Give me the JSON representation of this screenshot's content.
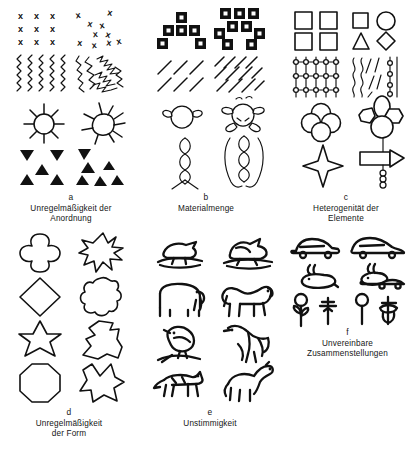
{
  "figure": {
    "title_fragment": "",
    "background_color": "#ffffff",
    "ink_color": "#111111"
  },
  "panels": [
    {
      "id": "a",
      "letter": "a",
      "title_line1": "Unregelmäßigkeit der",
      "title_line2": "Anordnung",
      "title_full": "Unregelmäßigkeit der Anordnung",
      "rows": [
        {
          "name": "x-grid",
          "left": "regular 3x3 grid of X marks",
          "right": "scattered X marks"
        },
        {
          "name": "zigzag-lines",
          "left": "even vertical zigzag lines",
          "right": "uneven tangled zigzag lines"
        },
        {
          "name": "sun",
          "left": "sun with evenly spaced rays",
          "right": "sun with irregular rays"
        },
        {
          "name": "triangles",
          "left": "regularly placed triangles",
          "right": "irregularly placed triangles"
        }
      ]
    },
    {
      "id": "b",
      "letter": "b",
      "title_line1": "Materialmenge",
      "title_line2": "",
      "title_full": "Materialmenge",
      "rows": [
        {
          "name": "filled-squares",
          "left": "six filled squares in a pyramid",
          "right": "nine filled squares, denser"
        },
        {
          "name": "hatching",
          "left": "sparse diagonal hatching",
          "right": "dense diagonal hatching"
        },
        {
          "name": "figure-head",
          "left": "simple head with two arms",
          "right": "head with extra limbs and marks"
        },
        {
          "name": "braid",
          "left": "single braided column",
          "right": "braided column with added outer loops"
        }
      ]
    },
    {
      "id": "c",
      "letter": "c",
      "title_line1": "Heterogenität der",
      "title_line2": "Elemente",
      "title_full": "Heterogenität der Elemente",
      "rows": [
        {
          "name": "shape-quartet",
          "left": "four identical squares",
          "right": "square, circle, triangle, diamond"
        },
        {
          "name": "bead-strings",
          "left": "five identical beaded strings",
          "right": "wavy lines mixed with a beaded string"
        },
        {
          "name": "circle-cluster",
          "left": "four identical circles in a rosette",
          "right": "mixed oval, hexagon and circle cluster"
        },
        {
          "name": "star-object",
          "left": "four-pointed star",
          "right": "bar, wedge and beaded stem assembly"
        }
      ]
    },
    {
      "id": "d",
      "letter": "d",
      "title_line1": "Unregelmäßigkeit",
      "title_line2": "der  Form",
      "title_full": "Unregelmäßigkeit der Form",
      "rows": [
        {
          "name": "quatrefoil",
          "left": "regular quatrefoil",
          "right": "ragged star blob"
        },
        {
          "name": "diamond",
          "left": "regular diamond",
          "right": "irregular rounded blob"
        },
        {
          "name": "six-point-star",
          "left": "regular six-pointed star",
          "right": "distorted angular blob"
        },
        {
          "name": "octagon",
          "left": "regular octagon",
          "right": "irregular spiky blob"
        }
      ]
    },
    {
      "id": "e",
      "letter": "e",
      "title_line1": "Unstimmigkeit",
      "title_line2": "",
      "title_full": "Unstimmigkeit",
      "rows": [
        {
          "name": "bird-water",
          "left": "duck on water",
          "right": "malformed duck"
        },
        {
          "name": "elephant",
          "left": "elephant",
          "right": "distorted elephant"
        },
        {
          "name": "perched-bird",
          "left": "bird on a branch",
          "right": "distorted bird"
        },
        {
          "name": "dog",
          "left": "dog",
          "right": "distorted long-necked animal"
        }
      ]
    },
    {
      "id": "f",
      "letter": "f",
      "title_line1": "Unvereinbare",
      "title_line2": "Zusammenstellungen",
      "title_full": "Unvereinbare Zusammenstellungen",
      "rows": [
        {
          "name": "car-rabbit",
          "left": "car above, rabbit below",
          "right": "car and rabbit fused together"
        },
        {
          "name": "flower",
          "left": "flower and separate bud",
          "right": "flower merged with bud"
        }
      ]
    }
  ]
}
